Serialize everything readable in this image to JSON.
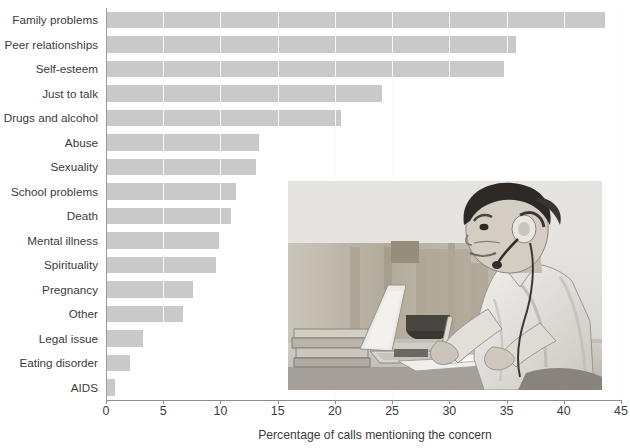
{
  "chart_data": {
    "type": "bar",
    "orientation": "horizontal",
    "title": "",
    "xlabel": "Percentage of calls mentioning the concern",
    "ylabel": "",
    "xlim": [
      0,
      45
    ],
    "xticks": [
      0,
      5,
      10,
      15,
      20,
      25,
      30,
      35,
      40,
      45
    ],
    "xtick_labels": [
      "0",
      "5",
      "10",
      "15",
      "20",
      "25",
      "30",
      "35",
      "40",
      "45"
    ],
    "grid": true,
    "grid_axis": "x",
    "legend": null,
    "bar_color": "#c9c9c9",
    "categories": [
      "Family problems",
      "Peer relationships",
      "Self-esteem",
      "Just to talk",
      "Drugs and alcohol",
      "Abuse",
      "Sexuality",
      "School problems",
      "Death",
      "Mental illness",
      "Spirituality",
      "Pregnancy",
      "Other",
      "Legal issue",
      "Eating disorder",
      "AIDS"
    ],
    "values": [
      43.6,
      35.8,
      34.8,
      24.1,
      20.5,
      13.4,
      13.1,
      11.4,
      10.9,
      9.9,
      9.6,
      7.6,
      6.7,
      3.2,
      2.1,
      0.8
    ]
  },
  "axis": {
    "x_title": "Percentage of calls mentioning the concern"
  },
  "photo": {
    "alt_name": "call-center-counselor-photo",
    "description": "Black and white photograph of a person wearing a telephone headset, seated at a desk writing on papers beside an open laptop and a stack of books"
  }
}
